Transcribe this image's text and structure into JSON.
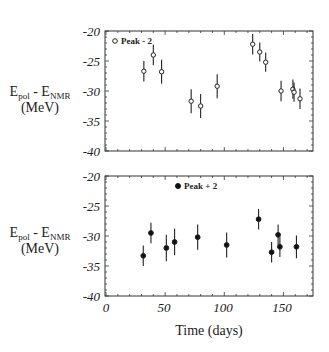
{
  "chart_data": [
    {
      "type": "scatter",
      "panel": "top",
      "title": "",
      "xlabel": "",
      "ylabel": {
        "main": "E",
        "sub1": "pol",
        "mid": " - E",
        "sub2": "NMR",
        "units": "(MeV)"
      },
      "xlim": [
        0,
        175
      ],
      "ylim": [
        -40,
        -20
      ],
      "yticks": [
        "-20",
        "-25",
        "-30",
        "-35",
        "-40"
      ],
      "ytick_values": [
        -20,
        -25,
        -30,
        -35,
        -40
      ],
      "legend": {
        "label": "Peak - 2",
        "marker": "open-circle",
        "position": "top-left"
      },
      "series": [
        {
          "name": "Peak - 2",
          "marker": "open-circle",
          "points": [
            {
              "x": 32,
              "y": -26.7,
              "err": 1.7
            },
            {
              "x": 40,
              "y": -24.0,
              "err": 1.7
            },
            {
              "x": 47,
              "y": -26.8,
              "err": 2.0
            },
            {
              "x": 72,
              "y": -31.7,
              "err": 2.0
            },
            {
              "x": 80,
              "y": -32.5,
              "err": 2.0
            },
            {
              "x": 94,
              "y": -29.2,
              "err": 2.0
            },
            {
              "x": 124,
              "y": -22.2,
              "err": 1.7
            },
            {
              "x": 130,
              "y": -23.5,
              "err": 1.6
            },
            {
              "x": 135,
              "y": -25.2,
              "err": 1.6
            },
            {
              "x": 148,
              "y": -30.0,
              "err": 1.7
            },
            {
              "x": 158,
              "y": -29.7,
              "err": 1.6
            },
            {
              "x": 159,
              "y": -30.2,
              "err": 1.6
            },
            {
              "x": 164,
              "y": -31.3,
              "err": 1.7
            }
          ]
        }
      ]
    },
    {
      "type": "scatter",
      "panel": "bottom",
      "title": "",
      "xlabel": "Time (days)",
      "ylabel": {
        "main": "E",
        "sub1": "pol",
        "mid": " - E",
        "sub2": "NMR",
        "units": "(MeV)"
      },
      "xlim": [
        0,
        175
      ],
      "ylim": [
        -40,
        -20
      ],
      "xticks": [
        "0",
        "50",
        "100",
        "150"
      ],
      "xtick_values": [
        0,
        50,
        100,
        150
      ],
      "yticks": [
        "-20",
        "-25",
        "-30",
        "-35",
        "-40"
      ],
      "ytick_values": [
        -20,
        -25,
        -30,
        -35,
        -40
      ],
      "legend": {
        "label": "Peak + 2",
        "marker": "filled-circle",
        "position": "top-center"
      },
      "series": [
        {
          "name": "Peak + 2",
          "marker": "filled-circle",
          "points": [
            {
              "x": 31.5,
              "y": -33.3,
              "err": 1.7
            },
            {
              "x": 38,
              "y": -29.5,
              "err": 1.7
            },
            {
              "x": 51,
              "y": -32.0,
              "err": 2.2
            },
            {
              "x": 58,
              "y": -31.0,
              "err": 2.2
            },
            {
              "x": 77.5,
              "y": -30.2,
              "err": 2.1
            },
            {
              "x": 102,
              "y": -31.5,
              "err": 2.1
            },
            {
              "x": 129,
              "y": -27.2,
              "err": 1.7
            },
            {
              "x": 140,
              "y": -32.7,
              "err": 1.7
            },
            {
              "x": 145.5,
              "y": -29.8,
              "err": 1.7
            },
            {
              "x": 147,
              "y": -31.8,
              "err": 1.7
            },
            {
              "x": 161,
              "y": -31.8,
              "err": 1.9
            }
          ]
        }
      ]
    }
  ]
}
